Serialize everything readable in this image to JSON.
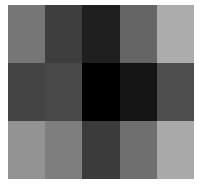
{
  "chart_data": {
    "type": "heatmap",
    "title": "",
    "xlabel": "",
    "ylabel": "",
    "rows": 3,
    "cols": 5,
    "colormap": "grayscale",
    "values": [
      [
        0.45,
        0.25,
        0.12,
        0.4,
        0.68
      ],
      [
        0.26,
        0.28,
        0.0,
        0.08,
        0.3
      ],
      [
        0.58,
        0.5,
        0.24,
        0.44,
        0.68
      ]
    ],
    "colors": [
      [
        "#767676",
        "#3e3e3e",
        "#1f1f1f",
        "#656565",
        "#acacac"
      ],
      [
        "#444444",
        "#494949",
        "#000000",
        "#141414",
        "#4e4e4e"
      ],
      [
        "#939393",
        "#7e7e7e",
        "#3b3b3b",
        "#6f6f6f",
        "#a9a9a9"
      ]
    ]
  }
}
